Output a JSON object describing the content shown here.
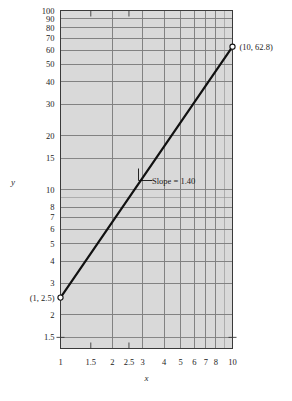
{
  "chart_data": {
    "type": "line",
    "title": "",
    "xlabel": "x",
    "ylabel": "y",
    "xscale": "log",
    "yscale": "log",
    "xlim": [
      1,
      10
    ],
    "ylim": [
      1.3,
      100
    ],
    "grid": true,
    "legend": false,
    "x": [
      1,
      10
    ],
    "values": [
      2.5,
      62.8
    ],
    "series": [
      {
        "name": "power-law fit",
        "x": [
          1,
          10
        ],
        "values": [
          2.5,
          62.8
        ]
      }
    ],
    "xticks": [
      1,
      1.5,
      2,
      2.5,
      3,
      4,
      5,
      6,
      7,
      8,
      10
    ],
    "xticklabels": [
      "1",
      "1.5",
      "2",
      "2.5",
      "3",
      "4",
      "5",
      "6",
      "7",
      "8",
      "10"
    ],
    "yticks": [
      1.5,
      2,
      3,
      4,
      5,
      6,
      7,
      8,
      10,
      15,
      20,
      30,
      40,
      50,
      60,
      70,
      80,
      90,
      100
    ],
    "yticklabels": [
      "1.5",
      "2",
      "3",
      "4",
      "5",
      "6",
      "7",
      "8",
      "10",
      "15",
      "20",
      "30",
      "40",
      "50",
      "60",
      "70",
      "80",
      "90",
      "100"
    ],
    "annotations": [
      {
        "name": "lower-point",
        "text": "(1, 2.5)",
        "x": 1,
        "y": 2.5
      },
      {
        "name": "upper-point",
        "text": "(10, 62.8)",
        "x": 10,
        "y": 62.8
      },
      {
        "name": "slope",
        "text": "Slope = 1.40",
        "x": 3.1,
        "y": 12.2
      }
    ],
    "markers": [
      {
        "x": 1,
        "y": 2.5,
        "style": "open-circle"
      },
      {
        "x": 10,
        "y": 62.8,
        "style": "open-circle"
      }
    ],
    "slope": 1.4
  },
  "labels": {
    "x_axis": "x",
    "y_axis": "y",
    "slope_text": "Slope = 1.40",
    "point_low": "(1, 2.5)",
    "point_high": "(10, 62.8)"
  },
  "colors": {
    "plot_background": "#d9d9d9",
    "gridline": "#7d7d7d",
    "minor_gridline": "#8f8f8f",
    "axis": "#3a3a3a",
    "data_line": "#111111",
    "text": "#1c1c1c",
    "page_background": "#ffffff"
  }
}
